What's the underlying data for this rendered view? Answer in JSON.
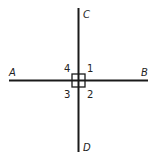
{
  "diagram": {
    "points": {
      "A": "A",
      "B": "B",
      "C": "C",
      "D": "D"
    },
    "angles": [
      "1",
      "2",
      "3",
      "4"
    ],
    "line_color": "#1a1a1a"
  }
}
